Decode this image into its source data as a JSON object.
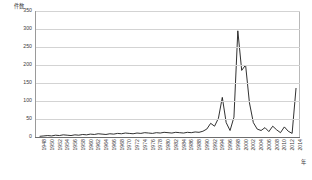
{
  "chart_data": {
    "type": "line",
    "title": "",
    "xlabel": "年",
    "ylabel": "件数",
    "ylim": [
      0,
      350
    ],
    "yticks": [
      0,
      50,
      100,
      150,
      200,
      250,
      300,
      350
    ],
    "grid": true,
    "legend": "none",
    "xlim": [
      1948,
      2014
    ],
    "xtick_step": 2,
    "xticks": [
      "1948",
      "1950",
      "1952",
      "1954",
      "1956",
      "1958",
      "1960",
      "1962",
      "1964",
      "1966",
      "1968",
      "1970",
      "1972",
      "1974",
      "1976",
      "1978",
      "1980",
      "1982",
      "1984",
      "1986",
      "1988",
      "1990",
      "1992",
      "1994",
      "1996",
      "1998",
      "2000",
      "2002",
      "2004",
      "2006",
      "2008",
      "2010",
      "2012",
      "2014"
    ],
    "x": [
      1948,
      1949,
      1950,
      1951,
      1952,
      1953,
      1954,
      1955,
      1956,
      1957,
      1958,
      1959,
      1960,
      1961,
      1962,
      1963,
      1964,
      1965,
      1966,
      1967,
      1968,
      1969,
      1970,
      1971,
      1972,
      1973,
      1974,
      1975,
      1976,
      1977,
      1978,
      1979,
      1980,
      1981,
      1982,
      1983,
      1984,
      1985,
      1986,
      1987,
      1988,
      1989,
      1990,
      1991,
      1992,
      1993,
      1994,
      1995,
      1996,
      1997,
      1998,
      1999,
      2000,
      2001,
      2002,
      2003,
      2004,
      2005,
      2006,
      2007,
      2008,
      2009,
      2010,
      2011,
      2012,
      2013,
      2014
    ],
    "values": [
      2,
      3,
      4,
      3,
      5,
      4,
      6,
      5,
      4,
      6,
      5,
      7,
      6,
      8,
      7,
      9,
      8,
      7,
      9,
      8,
      10,
      9,
      11,
      10,
      9,
      11,
      10,
      12,
      11,
      10,
      12,
      11,
      13,
      12,
      11,
      13,
      12,
      11,
      13,
      12,
      14,
      13,
      16,
      22,
      38,
      30,
      52,
      110,
      40,
      18,
      55,
      295,
      185,
      200,
      95,
      40,
      22,
      18,
      26,
      15,
      30,
      20,
      12,
      28,
      16,
      10,
      135
    ],
    "series_name": "件数",
    "line_color": "#1a1a1a",
    "grid_color": "#d3d3d3",
    "axis_color": "#6d6d6d"
  }
}
